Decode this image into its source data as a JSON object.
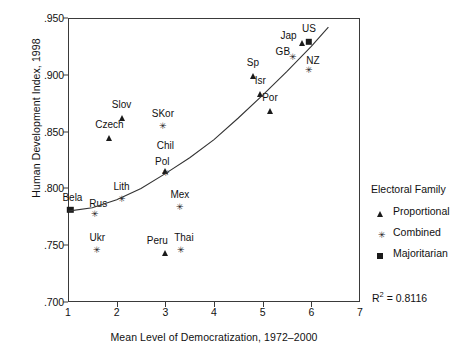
{
  "chart_data": {
    "type": "scatter",
    "title": "",
    "xlabel": "Mean Level of Democratization, 1972–2000",
    "ylabel": "Human Development Index, 1998",
    "xlim": [
      1,
      7
    ],
    "ylim": [
      0.7,
      0.95
    ],
    "xticks": [
      "1",
      "2",
      "3",
      "4",
      "5",
      "6",
      "7"
    ],
    "xtick_values": [
      1,
      2,
      3,
      4,
      5,
      6,
      7
    ],
    "yticks": [
      ".950",
      ".900",
      ".850",
      ".800",
      ".750",
      ".700"
    ],
    "ytick_values": [
      0.95,
      0.9,
      0.85,
      0.8,
      0.75,
      0.7
    ],
    "grid": false,
    "legend_position": "right",
    "annotations": [
      {
        "name": "r2-annotation",
        "text": "R² = 0.8116",
        "r2": 0.8116
      }
    ],
    "trend_line": {
      "name": "fitted-curve",
      "description": "upward-curving exponential fit line",
      "points": [
        [
          1.0,
          0.78
        ],
        [
          1.5,
          0.783
        ],
        [
          2.0,
          0.79
        ],
        [
          2.5,
          0.8
        ],
        [
          3.0,
          0.813
        ],
        [
          3.5,
          0.827
        ],
        [
          4.0,
          0.843
        ],
        [
          4.5,
          0.862
        ],
        [
          5.0,
          0.882
        ],
        [
          5.5,
          0.903
        ],
        [
          6.0,
          0.925
        ],
        [
          6.35,
          0.942
        ]
      ]
    },
    "series": [
      {
        "name": "Proportional",
        "marker": "triangle",
        "color": "#1a1a1a",
        "points": [
          {
            "label": "Slov",
            "x": 2.1,
            "y": 0.862,
            "label_dx": 0,
            "label_dy": -13
          },
          {
            "label": "Czech",
            "x": 1.85,
            "y": 0.844,
            "label_dx": 0,
            "label_dy": -13
          },
          {
            "label": "Sp",
            "x": 4.8,
            "y": 0.899,
            "label_dx": 0,
            "label_dy": -13
          },
          {
            "label": "Isr",
            "x": 4.95,
            "y": 0.883,
            "label_dx": 0,
            "label_dy": -13
          },
          {
            "label": "Por",
            "x": 5.15,
            "y": 0.868,
            "label_dx": 0,
            "label_dy": -13
          },
          {
            "label": "Peru",
            "x": 3.0,
            "y": 0.743,
            "label_dx": -8,
            "label_dy": -12
          },
          {
            "label": "Chil",
            "x": 3.0,
            "y": 0.815,
            "label_dx": 0,
            "label_dy": -25
          },
          {
            "label": "Jap",
            "x": 5.8,
            "y": 0.928,
            "label_dx": -13,
            "label_dy": -7
          }
        ]
      },
      {
        "name": "Combined",
        "marker": "asterisk",
        "color": "#1a1a1a",
        "points": [
          {
            "label": "SKor",
            "x": 2.95,
            "y": 0.854,
            "label_dx": 0,
            "label_dy": -13
          },
          {
            "label": "Pol",
            "x": 3.02,
            "y": 0.813,
            "label_dx": -4,
            "label_dy": -12
          },
          {
            "label": "Lith",
            "x": 2.1,
            "y": 0.79,
            "label_dx": 0,
            "label_dy": -13
          },
          {
            "label": "Mex",
            "x": 3.3,
            "y": 0.783,
            "label_dx": 0,
            "label_dy": -13
          },
          {
            "label": "Ukr",
            "x": 1.6,
            "y": 0.745,
            "label_dx": 0,
            "label_dy": -13
          },
          {
            "label": "Thai",
            "x": 3.32,
            "y": 0.745,
            "label_dx": 3,
            "label_dy": -13
          },
          {
            "label": "GB",
            "x": 5.62,
            "y": 0.915,
            "label_dx": -10,
            "label_dy": -6
          },
          {
            "label": "NZ",
            "x": 5.95,
            "y": 0.903,
            "label_dx": 4,
            "label_dy": -10
          },
          {
            "label": "Rus",
            "x": 1.56,
            "y": 0.777,
            "label_dx": 3,
            "label_dy": -11
          }
        ]
      },
      {
        "name": "Majoritarian",
        "marker": "square",
        "color": "#1a1a1a",
        "points": [
          {
            "label": "Bela",
            "x": 1.05,
            "y": 0.781,
            "label_dx": 2,
            "label_dy": -12
          },
          {
            "label": "US",
            "x": 5.95,
            "y": 0.929,
            "label_dx": 0,
            "label_dy": -13
          }
        ]
      }
    ]
  },
  "legend": {
    "title": "Electoral Family",
    "items": [
      {
        "symbol": "triangle",
        "label": "Proportional"
      },
      {
        "symbol": "asterisk",
        "label": "Combined"
      },
      {
        "symbol": "square",
        "label": "Majoritarian"
      }
    ]
  }
}
